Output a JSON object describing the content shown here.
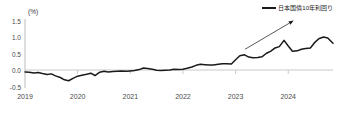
{
  "chart_data": {
    "type": "line",
    "title": "",
    "subtitle": "",
    "xlabel": "",
    "ylabel": "",
    "unit_label": "(%)",
    "grid": false,
    "legend_position": "top-right",
    "xlim": [
      2019.0,
      2024.85
    ],
    "ylim": [
      -0.5,
      1.6
    ],
    "xticks": [
      2019,
      2020,
      2021,
      2022,
      2023,
      2024
    ],
    "xtick_labels": [
      "2019",
      "2020",
      "2021",
      "2022",
      "2023",
      "2024"
    ],
    "yticks": [
      -0.5,
      0.0,
      0.5,
      1.0,
      1.5
    ],
    "ytick_labels": [
      "-0.5",
      "0.0",
      "0.5",
      "1.0",
      "1.5"
    ],
    "series": [
      {
        "name": "日本国債10年利回り",
        "color": "#1a1a1a",
        "x": [
          2019.0,
          2019.08,
          2019.17,
          2019.25,
          2019.33,
          2019.42,
          2019.5,
          2019.58,
          2019.67,
          2019.75,
          2019.83,
          2019.92,
          2020.0,
          2020.08,
          2020.17,
          2020.25,
          2020.33,
          2020.42,
          2020.5,
          2020.58,
          2020.67,
          2020.75,
          2020.83,
          2020.92,
          2021.0,
          2021.08,
          2021.17,
          2021.25,
          2021.33,
          2021.42,
          2021.5,
          2021.58,
          2021.67,
          2021.75,
          2021.83,
          2021.92,
          2022.0,
          2022.08,
          2022.17,
          2022.25,
          2022.33,
          2022.42,
          2022.5,
          2022.58,
          2022.67,
          2022.75,
          2022.83,
          2022.92,
          2023.0,
          2023.08,
          2023.17,
          2023.25,
          2023.33,
          2023.42,
          2023.5,
          2023.58,
          2023.67,
          2023.75,
          2023.83,
          2023.92,
          2024.0,
          2024.08,
          2024.17,
          2024.25,
          2024.33,
          2024.42,
          2024.5,
          2024.58,
          2024.67,
          2024.75,
          2024.85
        ],
        "y": [
          -0.01,
          -0.02,
          -0.04,
          -0.03,
          -0.06,
          -0.09,
          -0.07,
          -0.13,
          -0.18,
          -0.25,
          -0.28,
          -0.2,
          -0.14,
          -0.11,
          -0.08,
          -0.05,
          -0.12,
          -0.02,
          0.01,
          -0.01,
          0.0,
          0.01,
          0.02,
          0.01,
          0.02,
          0.03,
          0.06,
          0.11,
          0.09,
          0.07,
          0.04,
          0.03,
          0.04,
          0.05,
          0.07,
          0.06,
          0.07,
          0.1,
          0.14,
          0.19,
          0.22,
          0.21,
          0.2,
          0.2,
          0.22,
          0.24,
          0.24,
          0.23,
          0.36,
          0.48,
          0.51,
          0.44,
          0.42,
          0.43,
          0.45,
          0.55,
          0.62,
          0.72,
          0.76,
          0.95,
          0.78,
          0.62,
          0.63,
          0.68,
          0.7,
          0.72,
          0.88,
          1.0,
          1.05,
          1.02,
          0.86
        ]
      }
    ],
    "annotations": [
      {
        "type": "arrow",
        "name": "upward-trend-arrow",
        "color": "#1a1a1a",
        "x1": 2023.18,
        "y1": 0.68,
        "x2": 2024.08,
        "y2": 1.53
      }
    ],
    "legend": [
      {
        "label": "日本国債10年利回り",
        "color": "#1a1a1a"
      }
    ]
  },
  "axis": {
    "unit": "(%)"
  }
}
